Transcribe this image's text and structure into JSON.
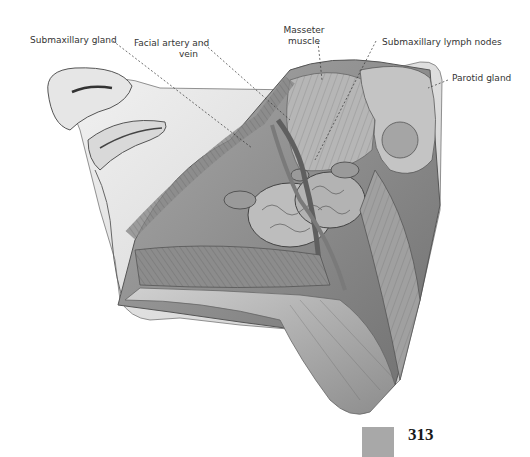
{
  "figure": {
    "labels": [
      {
        "id": "submaxillary-gland",
        "text": "Submaxillary gland"
      },
      {
        "id": "facial-artery-vein",
        "line1": "Facial artery and",
        "line2": "vein"
      },
      {
        "id": "masseter-muscle",
        "line1": "Masseter",
        "line2": "muscle"
      },
      {
        "id": "submaxillary-lymph-nodes",
        "text": "Submaxillary lymph nodes"
      },
      {
        "id": "parotid-gland",
        "text": "Parotid gland"
      }
    ]
  },
  "page": {
    "number": "313",
    "swatch_color": "#a8a8a8"
  }
}
